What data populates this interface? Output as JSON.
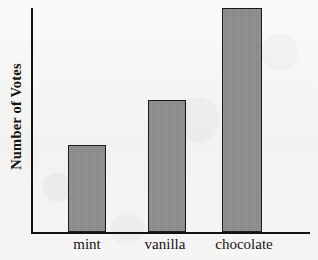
{
  "chart_data": {
    "type": "bar",
    "title": "",
    "xlabel": "",
    "ylabel": "Number of Votes",
    "categories": [
      "mint",
      "vanilla",
      "chocolate"
    ],
    "values": [
      3,
      4.5,
      7.5
    ],
    "value_fractions": [
      0.39,
      0.59,
      1.0
    ],
    "ylim": [
      0,
      7.5
    ],
    "grid": false,
    "legend": false,
    "axis_ticks": "none",
    "series": [
      {
        "name": "Votes",
        "values": [
          3,
          4.5,
          7.5
        ]
      }
    ]
  },
  "axes": {
    "y_label": "Number of Votes",
    "x_labels": [
      "mint",
      "vanilla",
      "chocolate"
    ]
  },
  "bars": [
    {
      "category": "mint",
      "height_pct": 39,
      "left_px": 35,
      "width_px": 38
    },
    {
      "category": "vanilla",
      "height_pct": 59,
      "left_px": 115,
      "width_px": 38
    },
    {
      "category": "chocolate",
      "height_pct": 100,
      "left_px": 189,
      "width_px": 40
    }
  ],
  "labels": {
    "mint_left": 61,
    "mint_width": 52,
    "vanilla_left": 134,
    "vanilla_width": 62,
    "chocolate_left": 203,
    "chocolate_width": 82
  },
  "colors": {
    "background": "#f6f6f5",
    "bar_fill": "#8b8b8b",
    "bar_border": "#1b1b1b",
    "axis": "#121212",
    "text": "#141414"
  }
}
